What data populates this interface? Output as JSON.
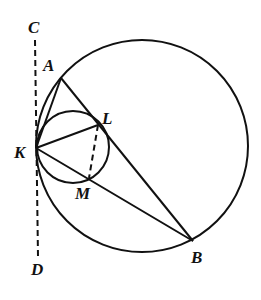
{
  "diagram": {
    "type": "geometry",
    "colors": {
      "stroke": "#111111",
      "background": "#ffffff"
    },
    "points": {
      "A": {
        "label": "A",
        "x": 61,
        "y": 78,
        "lx": 43,
        "ly": 71
      },
      "B": {
        "label": "B",
        "x": 193,
        "y": 241,
        "lx": 191,
        "ly": 263
      },
      "C": {
        "label": "C",
        "x": 35,
        "y": 40,
        "lx": 28,
        "ly": 33
      },
      "D": {
        "label": "D",
        "x": 38,
        "y": 257,
        "lx": 31,
        "ly": 275
      },
      "K": {
        "label": "K",
        "x": 36,
        "y": 148,
        "lx": 14,
        "ly": 158
      },
      "L": {
        "label": "L",
        "x": 98,
        "y": 125,
        "lx": 102,
        "ly": 124
      },
      "M": {
        "label": "M",
        "x": 89,
        "y": 178,
        "lx": 75,
        "ly": 199
      }
    },
    "circles": [
      {
        "name": "large-circle",
        "cx": 142,
        "cy": 146,
        "r": 106
      },
      {
        "name": "small-circle",
        "cx": 73,
        "cy": 147,
        "r": 36
      }
    ],
    "segments": [
      {
        "name": "segment-KA",
        "from": "K",
        "to": "A",
        "style": "solid"
      },
      {
        "name": "segment-AB",
        "from": "A",
        "to": "B",
        "style": "solid"
      },
      {
        "name": "segment-KL",
        "from": "K",
        "to": "L",
        "style": "solid"
      },
      {
        "name": "segment-KB",
        "from": "K",
        "to": "B",
        "style": "solid"
      },
      {
        "name": "segment-LM",
        "from": "L",
        "to": "M",
        "style": "dashed"
      },
      {
        "name": "tangent-line-CD",
        "from": "C",
        "to": "D",
        "style": "dashed"
      }
    ]
  }
}
